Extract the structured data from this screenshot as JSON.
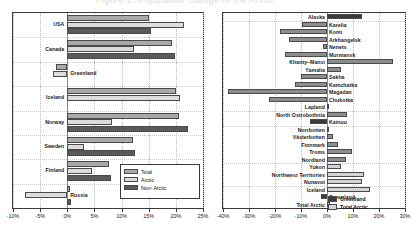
{
  "top_strip": {
    "clipped_text": "Figure 2. Population change in the Arctic"
  },
  "chart_data": [
    {
      "id": "left",
      "type": "bar",
      "orientation": "horizontal",
      "title": "",
      "xlabel": "",
      "ylabel": "",
      "xlim": [
        -10,
        25
      ],
      "xticks": [
        -10,
        -5,
        0,
        5,
        10,
        15,
        20,
        25
      ],
      "xtick_labels": [
        "-10%",
        "-5%",
        "0%",
        "5%",
        "10%",
        "15%",
        "20%",
        "25%"
      ],
      "grid": true,
      "legend_position": "lower right",
      "legend": [
        "Total",
        "Arctic",
        "Non- Arctic"
      ],
      "categories": [
        "USA",
        "Canada",
        "Greenland",
        "Iceland",
        "Norway",
        "Sweden",
        "Finland",
        "Russia"
      ],
      "series": [
        {
          "name": "Total",
          "color": "#a9a9a9",
          "values": [
            15.0,
            19.2,
            -2.1,
            20.0,
            20.6,
            12.1,
            7.6,
            0.5
          ]
        },
        {
          "name": "Arctic",
          "color": "#dcdcdc",
          "values": [
            21.5,
            12.3,
            -2.6,
            20.7,
            8.2,
            3.1,
            4.6,
            -7.8
          ]
        },
        {
          "name": "Non- Arctic",
          "color": "#5a5a5a",
          "values": [
            15.4,
            19.9,
            0.0,
            0.0,
            22.3,
            12.5,
            8.1,
            0.6
          ]
        }
      ]
    },
    {
      "id": "right",
      "type": "bar",
      "orientation": "horizontal",
      "title": "",
      "xlabel": "",
      "ylabel": "",
      "xlim": [
        -40,
        30
      ],
      "xticks": [
        -40,
        -30,
        -20,
        -10,
        0,
        10,
        20,
        30
      ],
      "xtick_labels": [
        "-40%",
        "-30%",
        "-20%",
        "-10%",
        "0%",
        "10%",
        "20%",
        "30%"
      ],
      "grid": true,
      "legend_position": "none",
      "categories": [
        "Alaska",
        "Karelia",
        "Komi",
        "Arkhangelsk",
        "Nenets",
        "Murmansk",
        "Khanty–Mansi",
        "Yamalia",
        "Sakha",
        "Kamchatka",
        "Magadan",
        "Chukotka",
        "Lapland",
        "North Ostrobothnia",
        "Kainuu",
        "Norrbotten",
        "Västerbotten",
        "Finnmark",
        "Troms",
        "Nordland",
        "Yukon",
        "Northwest Territories",
        "Nunavut",
        "Iceland",
        "Greenland",
        "Total Arctic"
      ],
      "values": [
        13.5,
        -9.5,
        -18.0,
        -14.5,
        -1.5,
        -16.0,
        25.5,
        5.5,
        -10.0,
        -12.5,
        -38.0,
        -22.5,
        0.8,
        7.5,
        -6.5,
        0.7,
        2.4,
        4.3,
        9.8,
        7.3,
        5.2,
        14.2,
        13.5,
        16.5,
        -2.3,
        1.2
      ],
      "bar_shades": [
        "dark",
        "mid",
        "mid",
        "mid",
        "mid",
        "mid",
        "mid",
        "mid",
        "mid",
        "mid",
        "mid",
        "mid",
        "mid",
        "mid",
        "dark",
        "mid",
        "mid",
        "mid",
        "mid",
        "mid",
        "light",
        "light",
        "light",
        "light",
        "dark",
        "light"
      ],
      "inline_legend": [
        {
          "label": "Greenland",
          "shade": "dark"
        },
        {
          "label": "Total Arctic",
          "shade": "light"
        }
      ]
    }
  ]
}
